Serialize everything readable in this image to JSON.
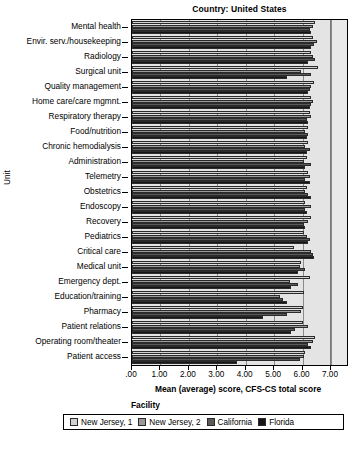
{
  "chart_data": {
    "type": "bar",
    "orientation": "horizontal",
    "title": "Country: United States",
    "xlabel": "Mean (average) score, CFS-CS total score",
    "ylabel": "Unit",
    "xlim": [
      0,
      7
    ],
    "xticks": [
      ".00",
      "1.00",
      "2.00",
      "3.00",
      "4.00",
      "5.00",
      "6.00",
      "7.00"
    ],
    "grid": true,
    "legend_title": "Facility",
    "legend_position": "bottom",
    "categories": [
      "Mental health",
      "Envir. serv./housekeeping",
      "Radiology",
      "Surgical unit",
      "Quality management",
      "Home care/care mgmnt.",
      "Respiratory therapy",
      "Food/nutrition",
      "Chronic hemodialysis",
      "Administration",
      "Telemetry",
      "Obstetrics",
      "Endoscopy",
      "Recovery",
      "Pediatrics",
      "Critical care",
      "Medical unit",
      "Emergency dept.",
      "Education/training",
      "Pharmacy",
      "Patient relations",
      "Operating room/theater",
      "Patient access"
    ],
    "series": [
      {
        "name": "New Jersey, 1",
        "color": "#d2d2d2",
        "values": [
          6.45,
          6.35,
          6.3,
          6.55,
          6.4,
          6.3,
          6.25,
          6.2,
          6.2,
          6.15,
          6.2,
          6.15,
          6.1,
          6.3,
          6.05,
          5.7,
          5.95,
          6.25,
          6.05,
          6.0,
          6.0,
          6.45,
          6.1
        ]
      },
      {
        "name": "New Jersey, 2",
        "color": "#9a9a9a",
        "values": [
          6.35,
          6.5,
          6.35,
          5.95,
          6.3,
          6.35,
          6.3,
          6.1,
          6.1,
          6.05,
          6.25,
          6.1,
          6.3,
          6.2,
          6.15,
          6.3,
          5.9,
          5.55,
          5.2,
          5.95,
          6.2,
          6.35,
          6.05
        ]
      },
      {
        "name": "California",
        "color": "#5a5a5a",
        "values": [
          6.25,
          6.4,
          6.45,
          6.3,
          6.25,
          6.3,
          6.15,
          6.2,
          6.25,
          6.3,
          6.1,
          6.2,
          6.1,
          6.05,
          6.25,
          6.35,
          6.1,
          5.85,
          5.3,
          5.45,
          5.75,
          6.2,
          5.9
        ]
      },
      {
        "name": "Florida",
        "color": "#161616",
        "values": [
          6.3,
          6.3,
          6.2,
          5.45,
          6.2,
          6.25,
          6.2,
          6.15,
          6.15,
          6.1,
          6.25,
          6.3,
          6.15,
          6.1,
          6.2,
          6.4,
          5.85,
          5.6,
          5.45,
          4.6,
          5.6,
          6.3,
          3.7
        ]
      }
    ]
  },
  "caption": ""
}
